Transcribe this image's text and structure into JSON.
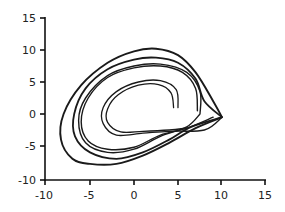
{
  "chart_data": {
    "type": "line",
    "title": "",
    "xlabel": "",
    "ylabel": "",
    "xlim": [
      -10,
      15
    ],
    "ylim": [
      -10,
      15
    ],
    "grid": false,
    "legend": null,
    "x_ticks": [
      "-10",
      "-5",
      "0",
      "5",
      "10",
      "15"
    ],
    "y_ticks": [
      "15",
      "10",
      "5",
      "0",
      "-5",
      "-10"
    ],
    "series": [
      {
        "name": "outer loop",
        "points": [
          [
            10,
            -0.5
          ],
          [
            9,
            2
          ],
          [
            7,
            6.5
          ],
          [
            5,
            9.2
          ],
          [
            2.5,
            10.2
          ],
          [
            0,
            9.8
          ],
          [
            -3,
            8
          ],
          [
            -6,
            4.5
          ],
          [
            -8,
            0
          ],
          [
            -8.3,
            -4
          ],
          [
            -7,
            -7
          ],
          [
            -5,
            -7.8
          ],
          [
            -2,
            -7.8
          ],
          [
            1,
            -6.5
          ],
          [
            4,
            -4.5
          ],
          [
            7,
            -2.2
          ],
          [
            10,
            -0.5
          ]
        ]
      },
      {
        "name": "second loop",
        "points": [
          [
            10,
            -0.5
          ],
          [
            8,
            2
          ],
          [
            7,
            5.5
          ],
          [
            5,
            8
          ],
          [
            2.5,
            8.8
          ],
          [
            0,
            8.5
          ],
          [
            -3,
            7
          ],
          [
            -5.5,
            4
          ],
          [
            -6.8,
            0
          ],
          [
            -6.7,
            -3.5
          ],
          [
            -5,
            -6
          ],
          [
            -2,
            -7
          ],
          [
            1,
            -6
          ],
          [
            4,
            -4
          ],
          [
            6.5,
            -2
          ],
          [
            10,
            -0.5
          ]
        ]
      },
      {
        "name": "third loop",
        "points": [
          [
            7.5,
            0
          ],
          [
            7.5,
            3.5
          ],
          [
            6,
            6.5
          ],
          [
            3,
            7.8
          ],
          [
            0,
            7.5
          ],
          [
            -3,
            6
          ],
          [
            -5.5,
            2.5
          ],
          [
            -6.3,
            -1
          ],
          [
            -5.5,
            -4.5
          ],
          [
            -3,
            -6
          ],
          [
            0,
            -5.5
          ],
          [
            3,
            -3.5
          ],
          [
            6,
            -2
          ],
          [
            7.5,
            0
          ]
        ]
      },
      {
        "name": "fourth loop",
        "points": [
          [
            7.2,
            0.5
          ],
          [
            7,
            4
          ],
          [
            5.5,
            6.5
          ],
          [
            3,
            7.5
          ],
          [
            0,
            7.2
          ],
          [
            -3,
            5.7
          ],
          [
            -5.2,
            2.5
          ],
          [
            -6,
            -1.2
          ],
          [
            -5.2,
            -4.2
          ],
          [
            -3,
            -5.5
          ],
          [
            0,
            -5.2
          ],
          [
            3,
            -3.3
          ],
          [
            6,
            -2.2
          ],
          [
            9,
            -0.5
          ]
        ]
      },
      {
        "name": "inner loop A",
        "points": [
          [
            5,
            1
          ],
          [
            4.8,
            3.8
          ],
          [
            3,
            5.2
          ],
          [
            0.5,
            5
          ],
          [
            -2,
            3.5
          ],
          [
            -3.5,
            1
          ],
          [
            -3.5,
            -1.5
          ],
          [
            -2,
            -3.3
          ],
          [
            1,
            -3
          ],
          [
            4,
            -2.7
          ],
          [
            8,
            -2.5
          ],
          [
            10,
            -0.5
          ]
        ]
      },
      {
        "name": "inner loop B",
        "points": [
          [
            4.5,
            1
          ],
          [
            4.2,
            3.3
          ],
          [
            2.8,
            4.6
          ],
          [
            0.5,
            4.5
          ],
          [
            -1.8,
            3
          ],
          [
            -3,
            0.8
          ],
          [
            -3,
            -1.3
          ],
          [
            -1.5,
            -2.8
          ],
          [
            1,
            -2.7
          ],
          [
            4,
            -2.5
          ],
          [
            6,
            -2.2
          ]
        ]
      }
    ]
  }
}
